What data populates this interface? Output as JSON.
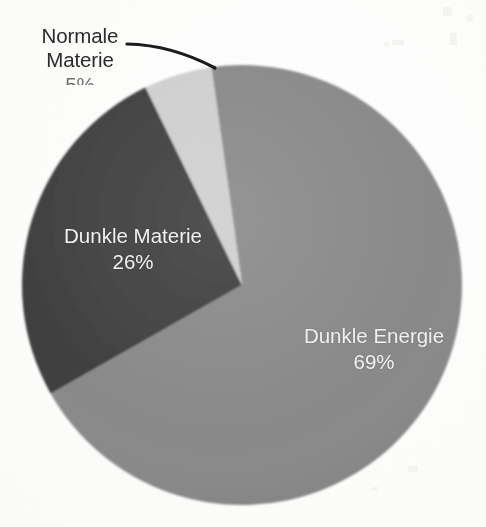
{
  "chart_data": {
    "type": "pie",
    "title": "",
    "subtitle": "",
    "xlabel": "",
    "ylabel": "",
    "legend_position": "none",
    "grid": false,
    "unit": "%",
    "categories": [
      "Dunkle Energie",
      "Dunkle Materie",
      "Normale Materie"
    ],
    "values": [
      69,
      26,
      5
    ],
    "slices": [
      {
        "label": "Dunkle Energie",
        "value": 69,
        "value_text": "69%",
        "color": "#8a8a8a",
        "label_placement": "inside",
        "label_color": "#f2f2f2"
      },
      {
        "label": "Dunkle Materie",
        "value": 26,
        "value_text": "26%",
        "color": "#3f3f3f",
        "label_placement": "inside",
        "label_color": "#f2f2f2"
      },
      {
        "label": "Normale Materie",
        "value": 5,
        "value_text": "5%",
        "color": "#d0d0d0",
        "label_placement": "outside",
        "label_color": "#2a2a2a",
        "has_leader_line": true,
        "value_text_clipped": true
      }
    ],
    "start_angle_deg": -8,
    "direction": "clockwise"
  },
  "chart": {
    "background_color": "#ffffff",
    "leader_line_color": "#1c1c1c",
    "normale_materie": {
      "name_line_1": "Normale",
      "name_line_2": "Materie",
      "percent": "5%"
    },
    "dunkle_materie": {
      "name": "Dunkle Materie",
      "percent": "26%"
    },
    "dunkle_energie": {
      "name": "Dunkle Energie",
      "percent": "69%"
    }
  }
}
